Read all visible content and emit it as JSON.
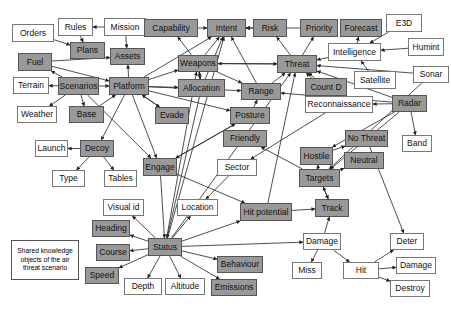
{
  "diagram": {
    "title": "Shared knowledge objects of the air threat scenario",
    "legend_lines": [
      "Shared knowledge",
      "objects of the air",
      "threat scenario"
    ],
    "colors": {
      "shared_fill": "#999999",
      "plain_fill": "#ffffff",
      "edge": "#222222"
    },
    "nodes": [
      {
        "id": "orders",
        "label": "Orders",
        "type": "plain",
        "x": 12,
        "y": 24,
        "w": 42,
        "h": 18
      },
      {
        "id": "rules",
        "label": "Rules",
        "type": "plain",
        "x": 58,
        "y": 18,
        "w": 35,
        "h": 18
      },
      {
        "id": "mission",
        "label": "Mission",
        "type": "plain",
        "x": 104,
        "y": 18,
        "w": 42,
        "h": 18
      },
      {
        "id": "plans",
        "label": "Plans",
        "type": "shared",
        "x": 70,
        "y": 42,
        "w": 35,
        "h": 17
      },
      {
        "id": "capability",
        "label": "Capability",
        "type": "shared",
        "x": 144,
        "y": 19,
        "w": 54,
        "h": 18
      },
      {
        "id": "intent",
        "label": "Intent",
        "type": "shared",
        "x": 207,
        "y": 19,
        "w": 39,
        "h": 18
      },
      {
        "id": "risk",
        "label": "Risk",
        "type": "shared",
        "x": 253,
        "y": 19,
        "w": 34,
        "h": 18
      },
      {
        "id": "priority",
        "label": "Priority",
        "type": "shared",
        "x": 300,
        "y": 19,
        "w": 38,
        "h": 18
      },
      {
        "id": "forecast",
        "label": "Forecast",
        "type": "shared",
        "x": 340,
        "y": 19,
        "w": 42,
        "h": 18
      },
      {
        "id": "e3d",
        "label": "E3D",
        "type": "plain",
        "x": 386,
        "y": 14,
        "w": 36,
        "h": 18
      },
      {
        "id": "assets",
        "label": "Assets",
        "type": "shared",
        "x": 110,
        "y": 48,
        "w": 35,
        "h": 17
      },
      {
        "id": "fuel",
        "label": "Fuel",
        "type": "shared",
        "x": 18,
        "y": 53,
        "w": 34,
        "h": 18
      },
      {
        "id": "intelligence",
        "label": "Intelligence",
        "type": "plain",
        "x": 328,
        "y": 43,
        "w": 53,
        "h": 18
      },
      {
        "id": "humint",
        "label": "Humint",
        "type": "plain",
        "x": 408,
        "y": 38,
        "w": 36,
        "h": 18
      },
      {
        "id": "weapons",
        "label": "Weapons",
        "type": "shared",
        "x": 178,
        "y": 55,
        "w": 40,
        "h": 17
      },
      {
        "id": "threat",
        "label": "Threat",
        "type": "shared",
        "x": 277,
        "y": 55,
        "w": 40,
        "h": 18
      },
      {
        "id": "terrain",
        "label": "Terrain",
        "type": "plain",
        "x": 13,
        "y": 77,
        "w": 36,
        "h": 17
      },
      {
        "id": "scenarios",
        "label": "Scenarios",
        "type": "shared",
        "x": 58,
        "y": 77,
        "w": 41,
        "h": 18
      },
      {
        "id": "platform",
        "label": "Platform",
        "type": "shared",
        "x": 109,
        "y": 77,
        "w": 40,
        "h": 18
      },
      {
        "id": "allocation",
        "label": "Allocation",
        "type": "shared",
        "x": 178,
        "y": 79,
        "w": 47,
        "h": 18
      },
      {
        "id": "range",
        "label": "Range",
        "type": "shared",
        "x": 241,
        "y": 83,
        "w": 40,
        "h": 17
      },
      {
        "id": "countd",
        "label": "Count D",
        "type": "shared",
        "x": 305,
        "y": 78,
        "w": 42,
        "h": 18
      },
      {
        "id": "satellite",
        "label": "Satellite",
        "type": "plain",
        "x": 354,
        "y": 71,
        "w": 42,
        "h": 18
      },
      {
        "id": "sonar",
        "label": "Sonar",
        "type": "plain",
        "x": 413,
        "y": 66,
        "w": 36,
        "h": 17
      },
      {
        "id": "weather",
        "label": "Weather",
        "type": "plain",
        "x": 17,
        "y": 106,
        "w": 40,
        "h": 17
      },
      {
        "id": "base",
        "label": "Base",
        "type": "shared",
        "x": 69,
        "y": 106,
        "w": 35,
        "h": 17
      },
      {
        "id": "evade",
        "label": "Evade",
        "type": "shared",
        "x": 155,
        "y": 107,
        "w": 34,
        "h": 17
      },
      {
        "id": "posture",
        "label": "Posture",
        "type": "shared",
        "x": 230,
        "y": 107,
        "w": 40,
        "h": 17
      },
      {
        "id": "reconnaissance",
        "label": "Reconnaissance",
        "type": "plain",
        "x": 305,
        "y": 96,
        "w": 68,
        "h": 17
      },
      {
        "id": "radar",
        "label": "Radar",
        "type": "shared",
        "x": 392,
        "y": 95,
        "w": 35,
        "h": 17
      },
      {
        "id": "friendly",
        "label": "Friendly",
        "type": "shared",
        "x": 223,
        "y": 130,
        "w": 44,
        "h": 17
      },
      {
        "id": "nothreat",
        "label": "No Threat",
        "type": "shared",
        "x": 345,
        "y": 130,
        "w": 43,
        "h": 17
      },
      {
        "id": "band",
        "label": "Band",
        "type": "plain",
        "x": 402,
        "y": 135,
        "w": 30,
        "h": 17
      },
      {
        "id": "launch",
        "label": "Launch",
        "type": "plain",
        "x": 35,
        "y": 140,
        "w": 33,
        "h": 17
      },
      {
        "id": "decoy",
        "label": "Decoy",
        "type": "shared",
        "x": 80,
        "y": 140,
        "w": 34,
        "h": 17
      },
      {
        "id": "hostile",
        "label": "Hostile",
        "type": "shared",
        "x": 300,
        "y": 147,
        "w": 33,
        "h": 18
      },
      {
        "id": "neutral",
        "label": "Neutral",
        "type": "shared",
        "x": 344,
        "y": 152,
        "w": 40,
        "h": 17
      },
      {
        "id": "engage",
        "label": "Engage",
        "type": "shared",
        "x": 143,
        "y": 158,
        "w": 34,
        "h": 18
      },
      {
        "id": "sector",
        "label": "Sector",
        "type": "plain",
        "x": 217,
        "y": 159,
        "w": 40,
        "h": 17
      },
      {
        "id": "type",
        "label": "Type",
        "type": "plain",
        "x": 52,
        "y": 170,
        "w": 33,
        "h": 17
      },
      {
        "id": "tables",
        "label": "Tables",
        "type": "plain",
        "x": 104,
        "y": 170,
        "w": 33,
        "h": 17
      },
      {
        "id": "targets",
        "label": "Targets",
        "type": "shared",
        "x": 299,
        "y": 169,
        "w": 41,
        "h": 18
      },
      {
        "id": "visualid",
        "label": "Visual id",
        "type": "plain",
        "x": 103,
        "y": 199,
        "w": 41,
        "h": 17
      },
      {
        "id": "location",
        "label": "Location",
        "type": "plain",
        "x": 177,
        "y": 199,
        "w": 41,
        "h": 17
      },
      {
        "id": "hitpotential",
        "label": "Hit potential",
        "type": "shared",
        "x": 240,
        "y": 203,
        "w": 52,
        "h": 18
      },
      {
        "id": "track",
        "label": "Track",
        "type": "shared",
        "x": 315,
        "y": 199,
        "w": 34,
        "h": 18
      },
      {
        "id": "heading",
        "label": "Heading",
        "type": "shared",
        "x": 92,
        "y": 220,
        "w": 38,
        "h": 17
      },
      {
        "id": "status",
        "label": "Status",
        "type": "shared",
        "x": 148,
        "y": 238,
        "w": 34,
        "h": 18
      },
      {
        "id": "course",
        "label": "Course",
        "type": "shared",
        "x": 96,
        "y": 244,
        "w": 34,
        "h": 17
      },
      {
        "id": "damage",
        "label": "Damage",
        "type": "plain",
        "x": 303,
        "y": 233,
        "w": 38,
        "h": 17
      },
      {
        "id": "deter",
        "label": "Deter",
        "type": "plain",
        "x": 390,
        "y": 233,
        "w": 34,
        "h": 17
      },
      {
        "id": "speed",
        "label": "Speed",
        "type": "shared",
        "x": 85,
        "y": 267,
        "w": 34,
        "h": 17
      },
      {
        "id": "depth",
        "label": "Depth",
        "type": "plain",
        "x": 124,
        "y": 278,
        "w": 38,
        "h": 17
      },
      {
        "id": "altitude",
        "label": "Altitude",
        "type": "plain",
        "x": 165,
        "y": 278,
        "w": 40,
        "h": 17
      },
      {
        "id": "behaviour",
        "label": "Behaviour",
        "type": "shared",
        "x": 217,
        "y": 256,
        "w": 46,
        "h": 17
      },
      {
        "id": "emissions",
        "label": "Emissions",
        "type": "shared",
        "x": 211,
        "y": 279,
        "w": 46,
        "h": 17
      },
      {
        "id": "miss",
        "label": "Miss",
        "type": "plain",
        "x": 292,
        "y": 262,
        "w": 30,
        "h": 17
      },
      {
        "id": "hit",
        "label": "Hit",
        "type": "plain",
        "x": 343,
        "y": 262,
        "w": 36,
        "h": 17
      },
      {
        "id": "damage2",
        "label": "Damage",
        "type": "plain",
        "x": 396,
        "y": 257,
        "w": 40,
        "h": 17
      },
      {
        "id": "destroy",
        "label": "Destroy",
        "type": "plain",
        "x": 390,
        "y": 280,
        "w": 40,
        "h": 17
      }
    ],
    "edges": [
      [
        "mission",
        "rules"
      ],
      [
        "mission",
        "assets"
      ],
      [
        "orders",
        "plans"
      ],
      [
        "rules",
        "plans"
      ],
      [
        "fuel",
        "assets"
      ],
      [
        "fuel",
        "platform"
      ],
      [
        "scenarios",
        "fuel"
      ],
      [
        "scenarios",
        "terrain"
      ],
      [
        "scenarios",
        "platform"
      ],
      [
        "scenarios",
        "weather"
      ],
      [
        "scenarios",
        "base"
      ],
      [
        "scenarios",
        "engage"
      ],
      [
        "platform",
        "assets"
      ],
      [
        "platform",
        "weapons"
      ],
      [
        "platform",
        "intent"
      ],
      [
        "platform",
        "allocation"
      ],
      [
        "platform",
        "evade"
      ],
      [
        "platform",
        "posture"
      ],
      [
        "platform",
        "decoy"
      ],
      [
        "platform",
        "engage"
      ],
      [
        "base",
        "platform"
      ],
      [
        "platform",
        "range"
      ],
      [
        "capability",
        "intent"
      ],
      [
        "risk",
        "intent"
      ],
      [
        "threat",
        "risk"
      ],
      [
        "threat",
        "priority"
      ],
      [
        "priority",
        "intent"
      ],
      [
        "intelligence",
        "forecast"
      ],
      [
        "intelligence",
        "threat"
      ],
      [
        "e3d",
        "intelligence"
      ],
      [
        "humint",
        "intelligence"
      ],
      [
        "satellite",
        "intelligence"
      ],
      [
        "sonar",
        "threat"
      ],
      [
        "sonar",
        "targets"
      ],
      [
        "weapons",
        "capability"
      ],
      [
        "weapons",
        "intent"
      ],
      [
        "weapons",
        "threat"
      ],
      [
        "threat",
        "weapons"
      ],
      [
        "allocation",
        "weapons"
      ],
      [
        "weapons",
        "allocation"
      ],
      [
        "allocation",
        "intent"
      ],
      [
        "range",
        "intent"
      ],
      [
        "range",
        "threat"
      ],
      [
        "countd",
        "threat"
      ],
      [
        "weapons",
        "range"
      ],
      [
        "evade",
        "platform"
      ],
      [
        "posture",
        "range"
      ],
      [
        "engage",
        "posture"
      ],
      [
        "decoy",
        "launch"
      ],
      [
        "decoy",
        "type"
      ],
      [
        "decoy",
        "tables"
      ],
      [
        "radar",
        "reconnaissance"
      ],
      [
        "radar",
        "band"
      ],
      [
        "radar",
        "hostile"
      ],
      [
        "radar",
        "targets"
      ],
      [
        "radar",
        "threat"
      ],
      [
        "radar",
        "range"
      ],
      [
        "reconnaissance",
        "threat"
      ],
      [
        "reconnaissance",
        "sector"
      ],
      [
        "targets",
        "hostile"
      ],
      [
        "targets",
        "neutral"
      ],
      [
        "hostile",
        "nothreat"
      ],
      [
        "targets",
        "friendly"
      ],
      [
        "targets",
        "track"
      ],
      [
        "track",
        "targets"
      ],
      [
        "hitpotential",
        "track"
      ],
      [
        "hitpotential",
        "threat"
      ],
      [
        "sector",
        "location"
      ],
      [
        "status",
        "visualid"
      ],
      [
        "status",
        "heading"
      ],
      [
        "status",
        "course"
      ],
      [
        "status",
        "speed"
      ],
      [
        "status",
        "depth"
      ],
      [
        "status",
        "altitude"
      ],
      [
        "status",
        "behaviour"
      ],
      [
        "status",
        "emissions"
      ],
      [
        "status",
        "location"
      ],
      [
        "status",
        "damage"
      ],
      [
        "status",
        "intent"
      ],
      [
        "status",
        "threat"
      ],
      [
        "status",
        "weapons"
      ],
      [
        "status",
        "hitpotential"
      ],
      [
        "engage",
        "hitpotential"
      ],
      [
        "damage",
        "track"
      ],
      [
        "damage",
        "miss"
      ],
      [
        "damage",
        "hit"
      ],
      [
        "hit",
        "deter"
      ],
      [
        "hit",
        "damage2"
      ],
      [
        "hit",
        "destroy"
      ],
      [
        "nothreat",
        "deter"
      ],
      [
        "allocation",
        "status"
      ],
      [
        "engage",
        "status"
      ],
      [
        "posture",
        "engage"
      ]
    ]
  }
}
